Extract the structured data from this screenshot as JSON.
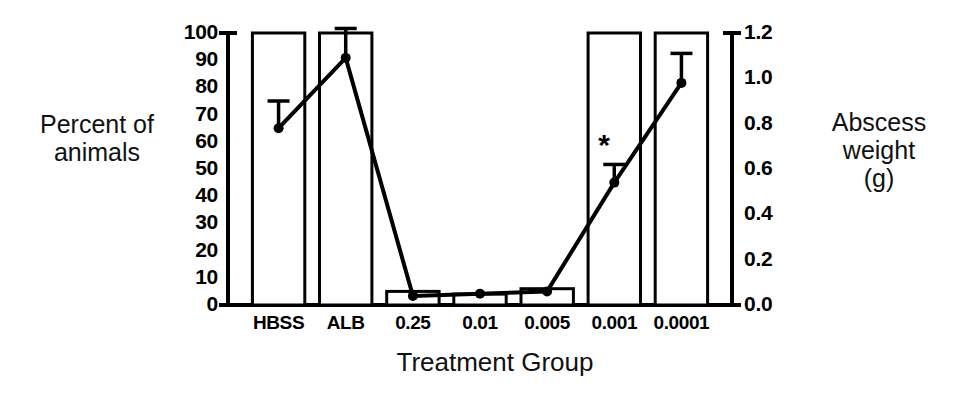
{
  "chart_data": {
    "type": "bar",
    "title": "",
    "xlabel": "Treatment Group",
    "categories": [
      "HBSS",
      "ALB",
      "0.25",
      "0.01",
      "0.005",
      "0.001",
      "0.0001"
    ],
    "grid": false,
    "legend": "none",
    "annotations": [
      {
        "text": "*",
        "category": "0.001",
        "series": "Abscess weight (g)",
        "meaning": "significant"
      }
    ],
    "series": [
      {
        "name": "Percent of animals",
        "type": "bar",
        "axis": "left",
        "ylabel": "Percent of\nanimals",
        "ylim": [
          0,
          100
        ],
        "yticks": [
          0,
          10,
          20,
          30,
          40,
          50,
          60,
          70,
          80,
          90,
          100
        ],
        "ytick_labels": [
          "0",
          "10",
          "20",
          "30",
          "40",
          "50",
          "60",
          "70",
          "80",
          "90",
          "100"
        ],
        "values": [
          100,
          100,
          5,
          4,
          6,
          100,
          100
        ]
      },
      {
        "name": "Abscess weight (g)",
        "type": "line",
        "axis": "right",
        "ylabel": "Abscess\nweight\n(g)",
        "ylim": [
          0.0,
          1.2
        ],
        "yticks": [
          0.0,
          0.2,
          0.4,
          0.6,
          0.8,
          1.0,
          1.2
        ],
        "ytick_labels": [
          "0.0",
          "0.2",
          "0.4",
          "0.6",
          "0.8",
          "1.0",
          "1.2"
        ],
        "values": [
          0.78,
          1.09,
          0.04,
          0.05,
          0.06,
          0.54,
          0.98
        ],
        "error_upper": [
          0.12,
          0.13,
          0.0,
          0.0,
          0.0,
          0.08,
          0.13
        ],
        "marker": "filled-circle"
      }
    ]
  },
  "labels": {
    "left_axis_title": "Percent of\nanimals",
    "right_axis_title": "Abscess\nweight\n(g)",
    "x_axis_title": "Treatment Group",
    "significance_marker": "*"
  },
  "colors": {
    "ink": "#000000",
    "background": "#ffffff",
    "bar_fill": "#ffffff"
  }
}
